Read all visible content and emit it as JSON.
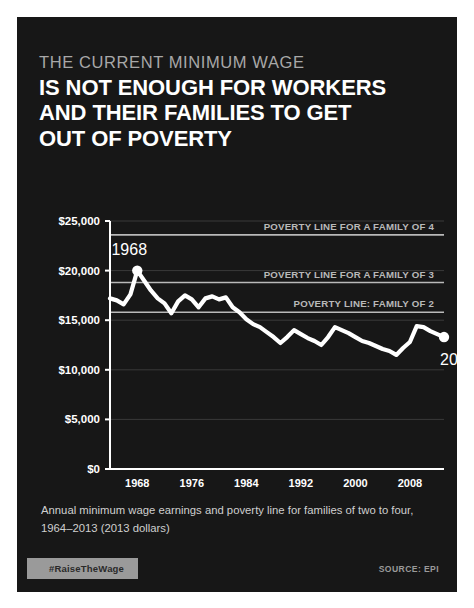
{
  "poster": {
    "background_color": "#171717",
    "kicker": "THE CURRENT MINIMUM WAGE",
    "headline_lines": [
      "IS NOT ENOUGH FOR WORKERS",
      "AND THEIR FAMILIES TO GET",
      "OUT OF POVERTY"
    ],
    "caption": "Annual minimum wage earnings and poverty line for families of two to four, 1964–2013 (2013 dollars)",
    "hashtag": "#RaiseTheWage",
    "source": "SOURCE: EPI",
    "accent_color": "#ffffff",
    "muted_color": "#b9b9b9",
    "badge_color": "#9a9a9a"
  },
  "chart_data": {
    "type": "line",
    "title": "",
    "xlabel": "",
    "ylabel": "",
    "xlim": [
      1964,
      2013
    ],
    "ylim": [
      0,
      25000
    ],
    "grid": true,
    "legend_position": "inline-annotations",
    "y_ticks": [
      0,
      5000,
      10000,
      15000,
      20000,
      25000
    ],
    "y_tick_labels": [
      "$0",
      "$5,000",
      "$10,000",
      "$15,000",
      "$20,000",
      "$25,000"
    ],
    "x_ticks": [
      1968,
      1976,
      1984,
      1992,
      2000,
      2008
    ],
    "x_tick_labels": [
      "1968",
      "1976",
      "1984",
      "1992",
      "2000",
      "2008"
    ],
    "series": [
      {
        "name": "Annual minimum wage earnings",
        "color": "#ffffff",
        "x": [
          1964,
          1965,
          1966,
          1967,
          1968,
          1969,
          1970,
          1971,
          1972,
          1973,
          1974,
          1975,
          1976,
          1977,
          1978,
          1979,
          1980,
          1981,
          1982,
          1983,
          1984,
          1985,
          1986,
          1987,
          1988,
          1989,
          1990,
          1991,
          1992,
          1993,
          1994,
          1995,
          1996,
          1997,
          1998,
          1999,
          2000,
          2001,
          2002,
          2003,
          2004,
          2005,
          2006,
          2007,
          2008,
          2009,
          2010,
          2011,
          2012,
          2013
        ],
        "values": [
          17200,
          17000,
          16600,
          17600,
          20000,
          19000,
          18000,
          17200,
          16700,
          15700,
          16900,
          17500,
          17100,
          16300,
          17200,
          17400,
          17100,
          17300,
          16300,
          15800,
          15100,
          14600,
          14300,
          13800,
          13300,
          12700,
          13300,
          14000,
          13600,
          13200,
          12900,
          12500,
          13300,
          14300,
          14000,
          13700,
          13300,
          12900,
          12700,
          12400,
          12100,
          11900,
          11500,
          12200,
          12800,
          14400,
          14300,
          13900,
          13600,
          13300
        ],
        "markers": [
          {
            "x": 1968,
            "y": 20000,
            "label": "1968",
            "label_position": "above-left"
          },
          {
            "x": 2013,
            "y": 13300,
            "label": "2013",
            "label_position": "below-left"
          }
        ]
      }
    ],
    "reference_lines": [
      {
        "name": "poverty-line-family-4",
        "label": "POVERTY LINE FOR A FAMILY OF 4",
        "value": 23600,
        "color": "#b9b9b9"
      },
      {
        "name": "poverty-line-family-3",
        "label": "POVERTY LINE FOR A FAMILY OF 3",
        "value": 18800,
        "color": "#b9b9b9"
      },
      {
        "name": "poverty-line-family-2",
        "label": "POVERTY LINE: FAMILY OF 2",
        "value": 15800,
        "color": "#b9b9b9"
      }
    ]
  }
}
